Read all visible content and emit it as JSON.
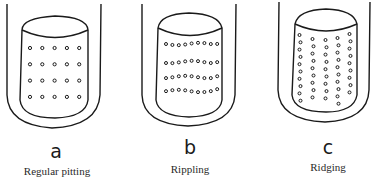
{
  "figure": {
    "panels": [
      {
        "letter": "a",
        "caption": "Regular pitting",
        "pattern": "regular-grid",
        "dot_columns": 5,
        "dot_rows": 4
      },
      {
        "letter": "b",
        "caption": "Rippling",
        "pattern": "horizontal-rows",
        "dot_columns": 9,
        "dot_rows": 4
      },
      {
        "letter": "c",
        "caption": "Ridging",
        "pattern": "vertical-columns",
        "dot_columns": 5,
        "dot_rows": 10
      }
    ],
    "colors": {
      "line": "#1a1a1a",
      "background": "#ffffff"
    }
  }
}
